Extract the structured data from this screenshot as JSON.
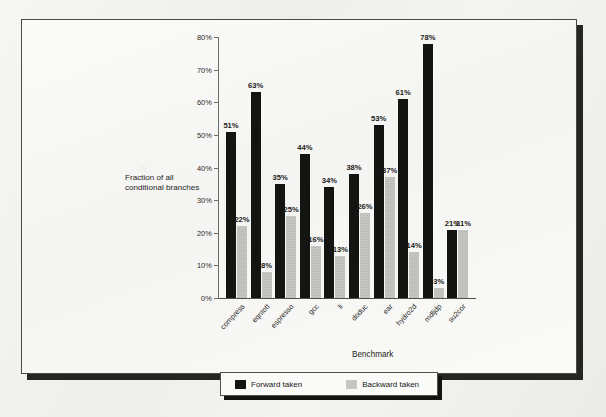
{
  "chart_data": {
    "type": "bar",
    "title": "",
    "xlabel": "Benchmark",
    "ylabel": "Fraction of all conditional branches",
    "ylim": [
      0,
      80
    ],
    "yticks": [
      "0%",
      "10%",
      "20%",
      "30%",
      "40%",
      "50%",
      "60%",
      "70%",
      "80%"
    ],
    "ytick_values": [
      0,
      10,
      20,
      30,
      40,
      50,
      60,
      70,
      80
    ],
    "grid": false,
    "legend_position": "bottom",
    "categories": [
      "compress",
      "eqntott",
      "espresso",
      "gcc",
      "li",
      "doduc",
      "ear",
      "hydro2d",
      "mdljdp",
      "su2cor"
    ],
    "series": [
      {
        "name": "Forward taken",
        "color": "#141412",
        "values": [
          51,
          63,
          35,
          44,
          34,
          38,
          53,
          61,
          78,
          21
        ],
        "labels": [
          "51%",
          "63%",
          "35%",
          "44%",
          "34%",
          "38%",
          "53%",
          "61%",
          "78%",
          "21%"
        ]
      },
      {
        "name": "Backward taken",
        "color": "#c6c6c3",
        "values": [
          22,
          8,
          25,
          16,
          13,
          26,
          37,
          14,
          3,
          21
        ],
        "labels": [
          "22%",
          "8%",
          "25%",
          "16%",
          "13%",
          "26%",
          "37%",
          "14%",
          "3%",
          "21%"
        ]
      }
    ]
  },
  "legend": {
    "items": [
      {
        "label": "Forward taken",
        "swatch": "dark-square-swatch"
      },
      {
        "label": "Backward taken",
        "swatch": "light-square-swatch"
      }
    ]
  }
}
